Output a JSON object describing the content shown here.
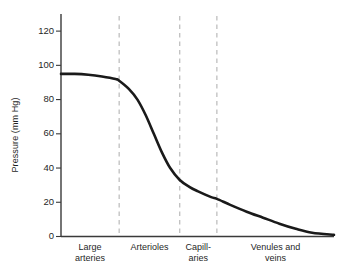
{
  "chart_data": {
    "type": "line",
    "title": "",
    "subtitle": "",
    "xlabel": "",
    "ylabel": "Pressure (mm Hg)",
    "ylim": [
      0,
      130
    ],
    "yticks": [
      0,
      20,
      40,
      60,
      80,
      100,
      120
    ],
    "ytick_labels": [
      "0",
      "20",
      "40",
      "60",
      "80",
      "100",
      "120"
    ],
    "xlim": [
      0,
      100
    ],
    "grid": false,
    "legend": null,
    "legend_position": "none",
    "line_color": "#1a1a1a",
    "divider_color": "#b3b3b3",
    "axis_color": "#3a3a3a",
    "categories": [
      {
        "label": "Large\narteries",
        "start": 0,
        "end": 21.3
      },
      {
        "label": "Arterioles",
        "start": 21.3,
        "end": 43.5
      },
      {
        "label": "Capill-\naries",
        "start": 43.5,
        "end": 57.1
      },
      {
        "label": "Venules and\nveins",
        "start": 57.1,
        "end": 100
      }
    ],
    "dividers_x": [
      21.3,
      43.5,
      57.1
    ],
    "series": [
      {
        "name": "Blood pressure",
        "x": [
          0,
          5,
          10,
          15,
          20,
          21.3,
          25,
          28,
          31,
          34,
          37,
          40,
          43.5,
          47,
          50,
          55,
          57.1,
          62,
          68,
          74,
          80,
          86,
          92,
          100
        ],
        "values": [
          95,
          95,
          94.5,
          93.5,
          92,
          91,
          86,
          80,
          71,
          60,
          49,
          40,
          33,
          29,
          26.5,
          23,
          22,
          18.5,
          14.5,
          11,
          7.5,
          4.5,
          2.2,
          1
        ]
      }
    ],
    "annotations": []
  },
  "axes": {
    "y_title": "Pressure (mm Hg)"
  }
}
